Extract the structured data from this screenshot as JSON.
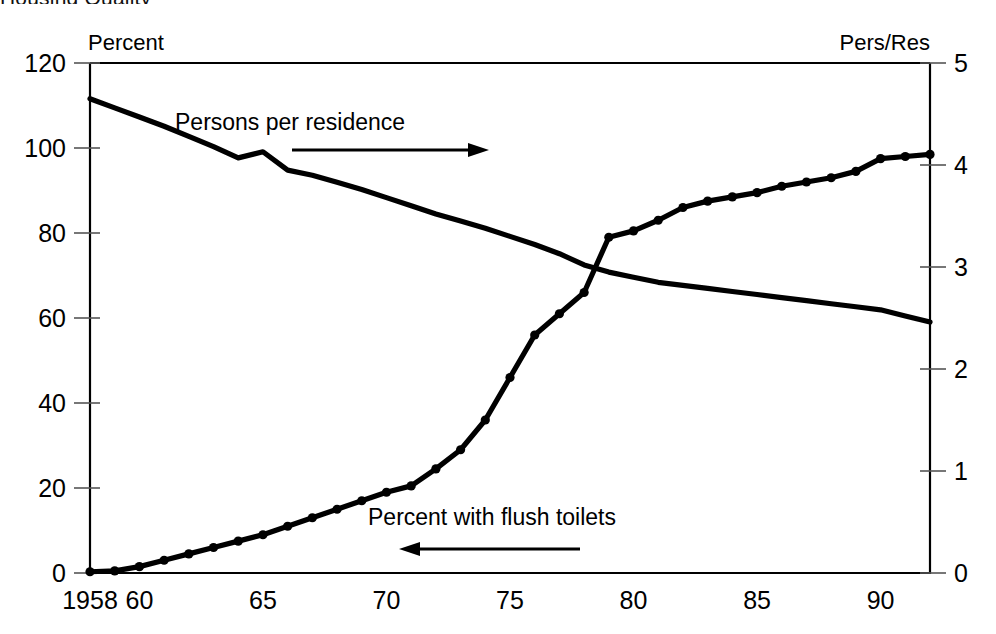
{
  "figure": {
    "clipped_top_text": "Housing Quality",
    "left_axis_title": "Percent",
    "right_axis_title": "Pers/Res"
  },
  "chart_data": {
    "type": "line",
    "title": "",
    "xlabel": "",
    "ylabel": "Percent",
    "y2label": "Pers/Res",
    "grid": false,
    "legend_position": "inline-annotations",
    "xlim": [
      1958,
      1992
    ],
    "ylim": [
      0,
      120
    ],
    "y2lim": [
      0,
      5
    ],
    "xticks": [
      1958,
      1960,
      1965,
      1970,
      1975,
      1980,
      1985,
      1990
    ],
    "xticklabels": [
      "1958",
      "60",
      "65",
      "70",
      "75",
      "80",
      "85",
      "90"
    ],
    "yticks": [
      0,
      20,
      40,
      60,
      80,
      100,
      120
    ],
    "yticklabels": [
      "0",
      "20",
      "40",
      "60",
      "80",
      "100",
      "120"
    ],
    "y2ticks": [
      0,
      1,
      2,
      3,
      4,
      5
    ],
    "y2ticklabels": [
      "0",
      "1",
      "2",
      "3",
      "4",
      "5"
    ],
    "x": [
      1958,
      1959,
      1960,
      1961,
      1962,
      1963,
      1964,
      1965,
      1966,
      1967,
      1968,
      1969,
      1970,
      1971,
      1972,
      1973,
      1974,
      1975,
      1976,
      1977,
      1978,
      1979,
      1980,
      1981,
      1982,
      1983,
      1984,
      1985,
      1986,
      1987,
      1988,
      1989,
      1990,
      1991,
      1992
    ],
    "series": [
      {
        "name": "Percent with flush toilets",
        "axis": "left",
        "markers": true,
        "annotation": "Percent with flush toilets",
        "annotation_arrow": "left",
        "values": [
          0.3,
          0.5,
          1.5,
          3.0,
          4.5,
          6.0,
          7.5,
          9.0,
          11.0,
          13.0,
          15.0,
          17.0,
          19.0,
          20.5,
          24.5,
          29.0,
          36.0,
          46.0,
          56.0,
          61.0,
          66.0,
          79.0,
          80.5,
          83.0,
          86.0,
          87.5,
          88.5,
          89.5,
          91.0,
          92.0,
          93.0,
          94.5,
          97.5,
          98.0,
          98.5
        ]
      },
      {
        "name": "Persons per residence",
        "axis": "right",
        "markers": false,
        "annotation": "Persons per residence",
        "annotation_arrow": "right",
        "values": [
          4.65,
          4.56,
          4.47,
          4.38,
          4.28,
          4.18,
          4.07,
          4.13,
          3.95,
          3.9,
          3.83,
          3.76,
          3.68,
          3.6,
          3.52,
          3.45,
          3.38,
          3.3,
          3.22,
          3.13,
          3.02,
          2.95,
          2.9,
          2.85,
          2.82,
          2.79,
          2.76,
          2.73,
          2.7,
          2.67,
          2.64,
          2.61,
          2.58,
          2.52,
          2.46
        ]
      }
    ]
  }
}
